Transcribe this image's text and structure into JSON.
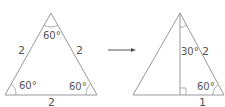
{
  "left_triangle": {
    "type": "equilateral",
    "sides": {
      "left": "2",
      "right": "2",
      "base": "2"
    },
    "angles": {
      "top": "60°",
      "bottom_left": "60°",
      "bottom_right": "60°"
    }
  },
  "arrow": {
    "direction": "right"
  },
  "right_triangle": {
    "type": "equilateral bisected by altitude",
    "labels": {
      "top_angle": "30°",
      "right_side": "2",
      "bottom_right_angle": "60°",
      "half_base": "1"
    },
    "right_angle_marker": true
  },
  "colors": {
    "stroke": "#888888",
    "text": "#555555",
    "background": "#ffffff"
  }
}
